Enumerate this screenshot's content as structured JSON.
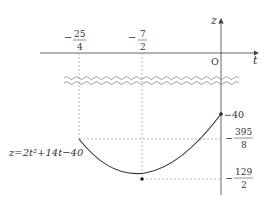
{
  "diagram": {
    "equation": "z=2t²+14t−40",
    "axes": {
      "x_label": "t",
      "y_label": "z",
      "origin_label": "O"
    },
    "x_ticks": [
      {
        "sign": "−",
        "num": "25",
        "den": "4"
      },
      {
        "sign": "−",
        "num": "7",
        "den": "2"
      }
    ],
    "y_ticks": [
      {
        "label": "−40"
      },
      {
        "sign": "−",
        "num": "395",
        "den": "8"
      },
      {
        "sign": "−",
        "num": "129",
        "den": "2"
      }
    ],
    "colors": {
      "axis": "#555555",
      "curve": "#333333",
      "guide": "#999999"
    }
  }
}
